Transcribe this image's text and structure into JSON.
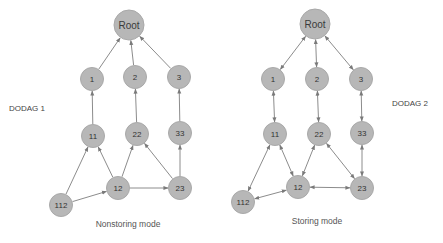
{
  "diagrams": [
    {
      "id": "dodag1",
      "label": "DODAG 1",
      "caption": "Nonstoring mode",
      "nodes": [
        {
          "id": "Root",
          "label": "Root",
          "root": true
        },
        {
          "id": "1",
          "label": "1"
        },
        {
          "id": "2",
          "label": "2"
        },
        {
          "id": "3",
          "label": "3"
        },
        {
          "id": "11",
          "label": "11"
        },
        {
          "id": "22",
          "label": "22"
        },
        {
          "id": "33",
          "label": "33"
        },
        {
          "id": "12",
          "label": "12"
        },
        {
          "id": "23",
          "label": "23"
        },
        {
          "id": "112",
          "label": "112"
        }
      ],
      "edges": [
        {
          "from": "1",
          "to": "Root",
          "direction": "forward"
        },
        {
          "from": "2",
          "to": "Root",
          "direction": "forward"
        },
        {
          "from": "3",
          "to": "Root",
          "direction": "forward"
        },
        {
          "from": "11",
          "to": "1",
          "direction": "forward"
        },
        {
          "from": "22",
          "to": "2",
          "direction": "forward"
        },
        {
          "from": "33",
          "to": "3",
          "direction": "forward"
        },
        {
          "from": "112",
          "to": "11",
          "direction": "forward"
        },
        {
          "from": "112",
          "to": "12",
          "direction": "forward"
        },
        {
          "from": "12",
          "to": "11",
          "direction": "forward"
        },
        {
          "from": "12",
          "to": "22",
          "direction": "forward"
        },
        {
          "from": "12",
          "to": "23",
          "direction": "forward"
        },
        {
          "from": "23",
          "to": "22",
          "direction": "forward"
        },
        {
          "from": "23",
          "to": "33",
          "direction": "forward"
        }
      ]
    },
    {
      "id": "dodag2",
      "label": "DODAG 2",
      "caption": "Storing mode",
      "nodes": [
        {
          "id": "Root",
          "label": "Root",
          "root": true
        },
        {
          "id": "1",
          "label": "1"
        },
        {
          "id": "2",
          "label": "2"
        },
        {
          "id": "3",
          "label": "3"
        },
        {
          "id": "11",
          "label": "11"
        },
        {
          "id": "22",
          "label": "22"
        },
        {
          "id": "33",
          "label": "33"
        },
        {
          "id": "12",
          "label": "12"
        },
        {
          "id": "23",
          "label": "23"
        },
        {
          "id": "112",
          "label": "112"
        }
      ],
      "edges": [
        {
          "from": "1",
          "to": "Root",
          "direction": "both"
        },
        {
          "from": "2",
          "to": "Root",
          "direction": "both"
        },
        {
          "from": "3",
          "to": "Root",
          "direction": "both"
        },
        {
          "from": "11",
          "to": "1",
          "direction": "both"
        },
        {
          "from": "22",
          "to": "2",
          "direction": "both"
        },
        {
          "from": "33",
          "to": "3",
          "direction": "both"
        },
        {
          "from": "112",
          "to": "11",
          "direction": "both"
        },
        {
          "from": "112",
          "to": "12",
          "direction": "both"
        },
        {
          "from": "12",
          "to": "11",
          "direction": "both"
        },
        {
          "from": "12",
          "to": "22",
          "direction": "both"
        },
        {
          "from": "12",
          "to": "23",
          "direction": "both"
        },
        {
          "from": "23",
          "to": "22",
          "direction": "both"
        },
        {
          "from": "23",
          "to": "33",
          "direction": "both"
        }
      ]
    }
  ]
}
